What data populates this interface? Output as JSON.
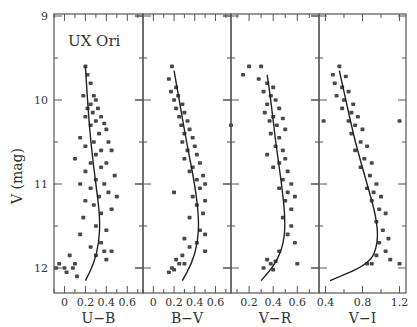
{
  "chart_data": {
    "type": "scatter",
    "title": "UX Ori",
    "ylabel": "V (mag)",
    "ylim": [
      9,
      12.3
    ],
    "y_inverted": true,
    "yticks": [
      9,
      10,
      11,
      12
    ],
    "grid": false,
    "legend": null,
    "annotations": [
      "UX Ori"
    ],
    "panels": [
      {
        "xlabel": "U−B",
        "xticks": [
          0,
          0.2,
          0.4,
          0.6
        ],
        "xtick_labels": [
          "0",
          "0.2",
          "0.4",
          "0.6"
        ],
        "xlim": [
          -0.1,
          0.75
        ],
        "fit_line": [
          [
            0.2,
            9.6
          ],
          [
            0.22,
            10.0
          ],
          [
            0.25,
            10.5
          ],
          [
            0.3,
            11.0
          ],
          [
            0.34,
            11.4
          ],
          [
            0.33,
            11.7
          ],
          [
            0.28,
            11.95
          ],
          [
            0.2,
            12.15
          ]
        ],
        "points": [
          [
            0.2,
            9.6
          ],
          [
            0.22,
            9.7
          ],
          [
            0.25,
            9.8
          ],
          [
            0.18,
            9.95
          ],
          [
            0.28,
            9.95
          ],
          [
            0.3,
            10.0
          ],
          [
            0.25,
            10.05
          ],
          [
            0.22,
            10.1
          ],
          [
            0.32,
            10.1
          ],
          [
            0.27,
            10.15
          ],
          [
            0.35,
            10.2
          ],
          [
            0.2,
            10.2
          ],
          [
            0.3,
            10.25
          ],
          [
            0.38,
            10.28
          ],
          [
            0.25,
            10.3
          ],
          [
            0.4,
            10.35
          ],
          [
            0.33,
            10.4
          ],
          [
            0.15,
            10.45
          ],
          [
            0.28,
            10.5
          ],
          [
            0.42,
            10.5
          ],
          [
            0.2,
            10.55
          ],
          [
            0.35,
            10.6
          ],
          [
            0.45,
            10.6
          ],
          [
            0.3,
            10.65
          ],
          [
            0.1,
            10.7
          ],
          [
            0.25,
            10.75
          ],
          [
            0.4,
            10.75
          ],
          [
            0.35,
            10.8
          ],
          [
            0.2,
            10.85
          ],
          [
            0.48,
            10.9
          ],
          [
            0.3,
            10.95
          ],
          [
            0.15,
            11.0
          ],
          [
            0.38,
            11.0
          ],
          [
            0.25,
            11.05
          ],
          [
            0.42,
            11.1
          ],
          [
            0.33,
            11.15
          ],
          [
            0.5,
            11.15
          ],
          [
            0.2,
            11.2
          ],
          [
            0.28,
            11.25
          ],
          [
            0.45,
            11.3
          ],
          [
            0.35,
            11.35
          ],
          [
            0.18,
            11.4
          ],
          [
            0.3,
            11.5
          ],
          [
            0.4,
            11.55
          ],
          [
            0.15,
            11.6
          ],
          [
            0.35,
            11.7
          ],
          [
            0.25,
            11.75
          ],
          [
            0.38,
            11.8
          ],
          [
            0.05,
            11.85
          ],
          [
            0.3,
            11.85
          ],
          [
            -0.05,
            11.95
          ],
          [
            0.0,
            12.0
          ],
          [
            -0.08,
            12.0
          ],
          [
            0.02,
            12.05
          ],
          [
            0.08,
            12.0
          ],
          [
            0.12,
            12.1
          ],
          [
            0.1,
            11.95
          ],
          [
            0.45,
            11.8
          ],
          [
            0.4,
            11.9
          ]
        ]
      },
      {
        "xlabel": "B−V",
        "xticks": [
          0,
          0.2,
          0.4,
          0.6
        ],
        "xtick_labels": [
          "0",
          "0.2",
          "0.4",
          "0.6"
        ],
        "xlim": [
          -0.1,
          0.75
        ],
        "fit_line": [
          [
            0.2,
            9.65
          ],
          [
            0.25,
            10.0
          ],
          [
            0.32,
            10.5
          ],
          [
            0.4,
            11.0
          ],
          [
            0.44,
            11.4
          ],
          [
            0.43,
            11.7
          ],
          [
            0.37,
            11.95
          ],
          [
            0.28,
            12.15
          ]
        ],
        "points": [
          [
            0.18,
            9.6
          ],
          [
            0.15,
            9.75
          ],
          [
            0.22,
            9.85
          ],
          [
            0.17,
            9.9
          ],
          [
            0.24,
            9.95
          ],
          [
            0.2,
            10.0
          ],
          [
            0.28,
            10.05
          ],
          [
            0.22,
            10.1
          ],
          [
            0.3,
            10.15
          ],
          [
            0.25,
            10.2
          ],
          [
            0.33,
            10.25
          ],
          [
            0.27,
            10.3
          ],
          [
            0.35,
            10.35
          ],
          [
            0.3,
            10.4
          ],
          [
            0.38,
            10.45
          ],
          [
            0.28,
            10.5
          ],
          [
            0.4,
            10.55
          ],
          [
            0.33,
            10.6
          ],
          [
            0.42,
            10.65
          ],
          [
            0.3,
            10.7
          ],
          [
            0.45,
            10.75
          ],
          [
            0.38,
            10.8
          ],
          [
            0.35,
            10.85
          ],
          [
            0.48,
            10.9
          ],
          [
            0.42,
            10.95
          ],
          [
            0.5,
            11.0
          ],
          [
            0.2,
            11.1
          ],
          [
            0.45,
            11.05
          ],
          [
            0.38,
            11.15
          ],
          [
            0.5,
            11.2
          ],
          [
            0.42,
            11.25
          ],
          [
            0.48,
            11.35
          ],
          [
            0.35,
            11.4
          ],
          [
            0.45,
            11.55
          ],
          [
            0.5,
            11.6
          ],
          [
            0.3,
            11.65
          ],
          [
            0.42,
            11.7
          ],
          [
            0.35,
            11.75
          ],
          [
            0.5,
            11.8
          ],
          [
            0.28,
            11.85
          ],
          [
            0.22,
            11.9
          ],
          [
            0.25,
            11.95
          ],
          [
            0.18,
            12.0
          ],
          [
            0.3,
            11.95
          ],
          [
            0.15,
            12.05
          ],
          [
            0.2,
            12.02
          ]
        ]
      },
      {
        "xlabel": "V−R",
        "xticks": [
          0.2,
          0.4,
          0.6
        ],
        "xtick_labels": [
          "0.2",
          "0.4",
          "0.6"
        ],
        "xlim": [
          0.05,
          0.78
        ],
        "fit_line": [
          [
            0.35,
            9.7
          ],
          [
            0.38,
            10.0
          ],
          [
            0.42,
            10.5
          ],
          [
            0.47,
            11.0
          ],
          [
            0.5,
            11.4
          ],
          [
            0.49,
            11.7
          ],
          [
            0.42,
            11.95
          ],
          [
            0.3,
            12.15
          ]
        ],
        "points": [
          [
            0.2,
            9.6
          ],
          [
            0.3,
            9.6
          ],
          [
            0.15,
            9.7
          ],
          [
            0.28,
            9.75
          ],
          [
            0.35,
            9.8
          ],
          [
            0.4,
            9.85
          ],
          [
            0.32,
            9.9
          ],
          [
            0.38,
            9.95
          ],
          [
            0.42,
            10.0
          ],
          [
            0.35,
            10.05
          ],
          [
            0.45,
            10.1
          ],
          [
            0.33,
            10.15
          ],
          [
            0.4,
            10.2
          ],
          [
            0.48,
            10.22
          ],
          [
            0.37,
            10.25
          ],
          [
            0.43,
            10.3
          ],
          [
            0.05,
            10.3
          ],
          [
            0.5,
            10.35
          ],
          [
            0.38,
            10.4
          ],
          [
            0.45,
            10.45
          ],
          [
            0.42,
            10.55
          ],
          [
            0.48,
            10.6
          ],
          [
            0.35,
            10.65
          ],
          [
            0.5,
            10.7
          ],
          [
            0.45,
            10.75
          ],
          [
            0.4,
            10.8
          ],
          [
            0.52,
            10.85
          ],
          [
            0.48,
            10.95
          ],
          [
            0.55,
            11.0
          ],
          [
            0.45,
            11.05
          ],
          [
            0.52,
            11.1
          ],
          [
            0.58,
            11.15
          ],
          [
            0.5,
            11.2
          ],
          [
            0.55,
            11.3
          ],
          [
            0.48,
            11.4
          ],
          [
            0.55,
            11.5
          ],
          [
            0.52,
            11.6
          ],
          [
            0.58,
            11.7
          ],
          [
            0.45,
            11.8
          ],
          [
            0.35,
            11.9
          ],
          [
            0.38,
            11.95
          ],
          [
            0.32,
            12.0
          ],
          [
            0.42,
            11.92
          ],
          [
            0.4,
            12.02
          ],
          [
            0.6,
            11.95
          ]
        ]
      },
      {
        "xlabel": "V−I",
        "xticks": [
          0.4,
          0.8,
          1.2
        ],
        "xtick_labels": [
          "0.4",
          "0.8",
          "1.2"
        ],
        "xlim": [
          0.33,
          1.27
        ],
        "fit_line": [
          [
            0.55,
            9.65
          ],
          [
            0.62,
            10.0
          ],
          [
            0.72,
            10.5
          ],
          [
            0.85,
            11.0
          ],
          [
            0.95,
            11.4
          ],
          [
            0.97,
            11.7
          ],
          [
            0.88,
            11.95
          ],
          [
            0.45,
            12.15
          ]
        ],
        "points": [
          [
            0.55,
            9.6
          ],
          [
            0.48,
            9.7
          ],
          [
            0.62,
            9.72
          ],
          [
            0.5,
            9.8
          ],
          [
            0.58,
            9.85
          ],
          [
            0.65,
            9.9
          ],
          [
            0.52,
            9.95
          ],
          [
            0.6,
            10.0
          ],
          [
            0.7,
            10.05
          ],
          [
            0.58,
            10.1
          ],
          [
            0.68,
            10.15
          ],
          [
            0.75,
            10.2
          ],
          [
            0.65,
            10.25
          ],
          [
            0.72,
            10.3
          ],
          [
            0.38,
            10.25
          ],
          [
            1.2,
            10.25
          ],
          [
            0.8,
            10.35
          ],
          [
            0.68,
            10.4
          ],
          [
            0.78,
            10.5
          ],
          [
            0.85,
            10.55
          ],
          [
            0.72,
            10.6
          ],
          [
            0.82,
            10.7
          ],
          [
            0.9,
            10.75
          ],
          [
            0.78,
            10.8
          ],
          [
            0.88,
            10.9
          ],
          [
            0.95,
            11.0
          ],
          [
            0.85,
            11.05
          ],
          [
            0.92,
            11.1
          ],
          [
            1.0,
            11.15
          ],
          [
            0.9,
            11.2
          ],
          [
            0.98,
            11.3
          ],
          [
            1.05,
            11.35
          ],
          [
            0.95,
            11.45
          ],
          [
            1.02,
            11.55
          ],
          [
            1.08,
            11.65
          ],
          [
            0.98,
            11.7
          ],
          [
            1.05,
            11.8
          ],
          [
            0.95,
            11.85
          ],
          [
            1.1,
            11.9
          ],
          [
            0.9,
            11.95
          ],
          [
            0.85,
            11.95
          ],
          [
            1.2,
            11.95
          ]
        ]
      }
    ]
  }
}
